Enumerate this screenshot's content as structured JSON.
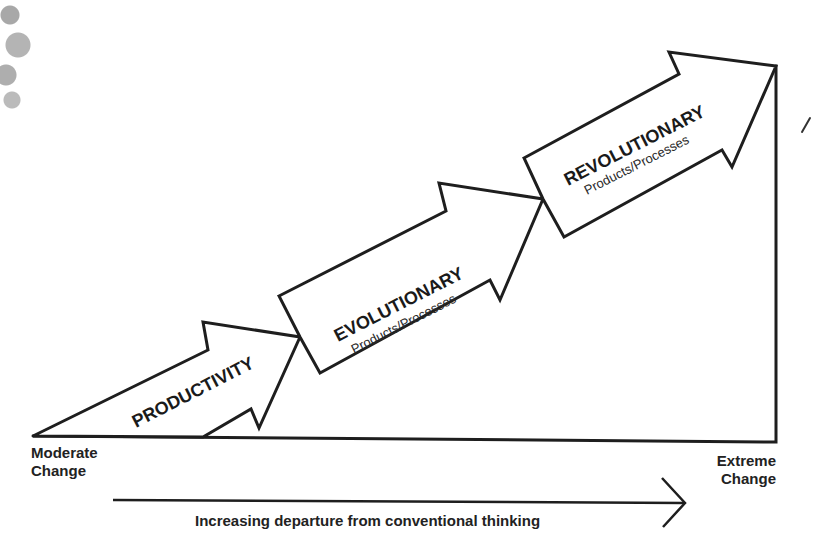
{
  "diagram": {
    "title": "",
    "stages": [
      {
        "id": "productivity",
        "label": "PRODUCTIVITY",
        "sublabel": ""
      },
      {
        "id": "evolutionary",
        "label": "EVOLUTIONARY",
        "sublabel": "Products/Processes"
      },
      {
        "id": "revolutionary",
        "label": "REVOLUTIONARY",
        "sublabel": "Products/Processes"
      }
    ],
    "axis": {
      "start_label_line1": "Moderate",
      "start_label_line2": "Change",
      "end_label_line1": "Extreme",
      "end_label_line2": "Change"
    },
    "caption": "Increasing departure from conventional thinking",
    "colors": {
      "stroke": "#1e1e1e",
      "fill": "#ffffff",
      "text": "#1a1a1a"
    },
    "icons": {
      "direction-arrow": "right-arrow-icon"
    }
  }
}
